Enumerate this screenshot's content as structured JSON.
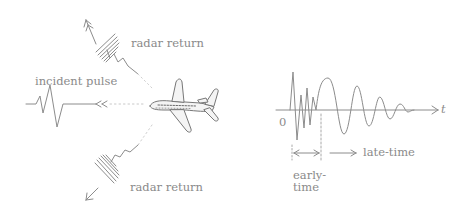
{
  "labels": {
    "radar_return_top": "radar return",
    "incident_pulse": "incident pulse",
    "radar_return_bottom": "radar return",
    "origin": "0",
    "time_axis": "t",
    "late_time": "late-time",
    "early_time_line1": "early-",
    "early_time_line2": "time"
  },
  "colors": {
    "stroke": "#8c8c8c",
    "text": "#8a8a8a",
    "background": "#ffffff"
  },
  "icons": {
    "aircraft": "airplane-sketch",
    "arrows": "arrow-right"
  }
}
